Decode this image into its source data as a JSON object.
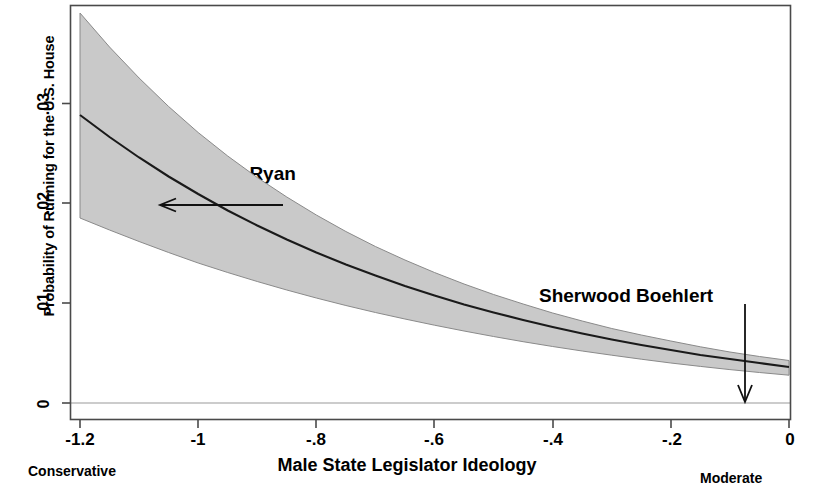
{
  "chart_data": {
    "type": "line",
    "title": "",
    "xlabel": "Male State Legislator Ideology",
    "ylabel": "Probability of Running for the U.S. House",
    "xlim": [
      -1.25,
      0.0
    ],
    "ylim": [
      -0.0008,
      0.0415
    ],
    "grid": false,
    "legend": "none",
    "xticks": [
      -1.2,
      -1,
      -0.8,
      -0.6,
      -0.4,
      -0.2,
      0
    ],
    "xtick_labels": [
      "-1.2",
      "-1",
      "-.8",
      "-.6",
      "-.4",
      "-.2",
      "0"
    ],
    "yticks": [
      0,
      0.01,
      0.02,
      0.03
    ],
    "ytick_labels": [
      "0",
      ".01",
      ".02",
      ".03"
    ],
    "x_axis_left_note": "Conservative",
    "x_axis_right_note": "Moderate",
    "series": [
      {
        "name": "Predicted probability",
        "style": "solid-line",
        "x": [
          -1.2,
          -1.15,
          -1.1,
          -1.05,
          -1.0,
          -0.95,
          -0.9,
          -0.85,
          -0.8,
          -0.75,
          -0.7,
          -0.65,
          -0.6,
          -0.55,
          -0.5,
          -0.45,
          -0.4,
          -0.35,
          -0.3,
          -0.25,
          -0.2,
          -0.15,
          -0.1,
          -0.05,
          0.0
        ],
        "values": [
          0.0288,
          0.0266,
          0.02455,
          0.02265,
          0.0209,
          0.01925,
          0.01775,
          0.01635,
          0.01505,
          0.01385,
          0.01275,
          0.0117,
          0.01075,
          0.00985,
          0.00905,
          0.0083,
          0.0076,
          0.00695,
          0.00635,
          0.0058,
          0.0053,
          0.0048,
          0.0044,
          0.004,
          0.0036
        ]
      },
      {
        "name": "95% confidence interval upper",
        "style": "shaded-band-edge",
        "x": [
          -1.2,
          -1.15,
          -1.1,
          -1.05,
          -1.0,
          -0.95,
          -0.9,
          -0.85,
          -0.8,
          -0.75,
          -0.7,
          -0.65,
          -0.6,
          -0.55,
          -0.5,
          -0.45,
          -0.4,
          -0.35,
          -0.3,
          -0.25,
          -0.2,
          -0.15,
          -0.1,
          -0.05,
          0.0
        ],
        "values": [
          0.039,
          0.0356,
          0.0325,
          0.02965,
          0.02705,
          0.0247,
          0.02255,
          0.0206,
          0.0188,
          0.01715,
          0.01565,
          0.0143,
          0.01305,
          0.0119,
          0.01085,
          0.0099,
          0.009,
          0.0082,
          0.00745,
          0.0068,
          0.0062,
          0.00562,
          0.0051,
          0.00465,
          0.00425
        ]
      },
      {
        "name": "95% confidence interval lower",
        "style": "shaded-band-edge",
        "x": [
          -1.2,
          -1.15,
          -1.1,
          -1.05,
          -1.0,
          -0.95,
          -0.9,
          -0.85,
          -0.8,
          -0.75,
          -0.7,
          -0.65,
          -0.6,
          -0.55,
          -0.5,
          -0.45,
          -0.4,
          -0.35,
          -0.3,
          -0.25,
          -0.2,
          -0.15,
          -0.1,
          -0.05,
          0.0
        ],
        "values": [
          0.0185,
          0.0173,
          0.01615,
          0.01505,
          0.014,
          0.01305,
          0.01215,
          0.0113,
          0.0105,
          0.00975,
          0.00905,
          0.0084,
          0.00778,
          0.0072,
          0.00665,
          0.00613,
          0.00565,
          0.0052,
          0.00478,
          0.00438,
          0.004,
          0.00366,
          0.00334,
          0.00305,
          0.00278
        ]
      }
    ],
    "annotations": [
      {
        "label": "Paul Ryan",
        "arrow": "left",
        "points_to_x": -1.06,
        "points_to_y": 0.0202
      },
      {
        "label": "Sherwood Boehlert",
        "arrow": "down",
        "points_to_x": -0.085,
        "points_to_y": 0.0008
      }
    ],
    "band_fill_color": "#c9c9c9",
    "line_color": "#1a1a1a",
    "frame_color": "#4a4a4a"
  }
}
